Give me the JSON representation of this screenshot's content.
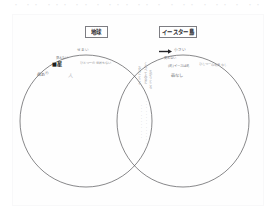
{
  "page": {
    "type": "handwritten-venn-diagram-worksheet",
    "background_color": "#ffffff",
    "frame_color": "#b9b9bd",
    "ink_color": "#35353a",
    "top_strip_text": "・ ・・ ・・・ ・・ ・ ・・・ ・・ ・ ・ ・・ ・ ・・ ・ ・・"
  },
  "labels": {
    "left": "地球",
    "right": "イースター島"
  },
  "diagram": {
    "type": "venn",
    "set_left": "地球",
    "set_right": "イースター島",
    "circle_left": {
      "cx": 86,
      "cy": 121,
      "r": 66
    },
    "circle_right": {
      "cx": 183,
      "cy": 121,
      "r": 66
    }
  },
  "annotations": {
    "left_only": [
      {
        "text": "せまい",
        "x": 77,
        "y": 49,
        "size": 3.6,
        "style": "blur"
      },
      {
        "text": "見えない",
        "x": 56,
        "y": 57,
        "size": 3.4,
        "style": "blur"
      },
      {
        "text": "ひとつ一の世界もない",
        "x": 80,
        "y": 62,
        "size": 3.2,
        "style": "fade"
      },
      {
        "text": "■星",
        "x": 52,
        "y": 63,
        "size": 5.2,
        "style": "bold"
      },
      {
        "text": "森あり",
        "x": 37,
        "y": 74,
        "size": 4.2,
        "style": "blur"
      },
      {
        "text": "人",
        "x": 68,
        "y": 74,
        "size": 5.0,
        "style": "faint"
      }
    ],
    "right_only": [
      {
        "text": "小さい",
        "x": 172,
        "y": 50,
        "size": 3.8,
        "style": "blur"
      },
      {
        "text": "見えない",
        "x": 164,
        "y": 58,
        "size": 3.4,
        "style": "blur"
      },
      {
        "text": "(島)イースは島",
        "x": 168,
        "y": 66,
        "size": 3.4,
        "style": "blur"
      },
      {
        "text": "ひとつ一の世界なし",
        "x": 199,
        "y": 64,
        "size": 3.2,
        "style": "fade"
      },
      {
        "text": "森なし",
        "x": 171,
        "y": 75,
        "size": 4.4,
        "style": "blur"
      }
    ],
    "overlap_vertical": [
      {
        "text": "くらべてみると",
        "x": 143,
        "y": 63,
        "size": 3.4,
        "style": "fade"
      },
      {
        "text": "おなじところ",
        "x": 138,
        "y": 66,
        "size": 3.2,
        "style": "fade"
      },
      {
        "text": "ちがうところ",
        "x": 148,
        "y": 70,
        "size": 3.2,
        "style": "fade"
      },
      {
        "text": "・・・・・・・・・・・・・・",
        "x": 145,
        "y": 102,
        "size": 3.0,
        "style": "faint"
      },
      {
        "text": "・・・・・・・・・・・",
        "x": 141,
        "y": 104,
        "size": 3.0,
        "style": "faint"
      }
    ],
    "marker": {
      "name": "arrow-marker",
      "x": 161,
      "y": 51
    }
  }
}
